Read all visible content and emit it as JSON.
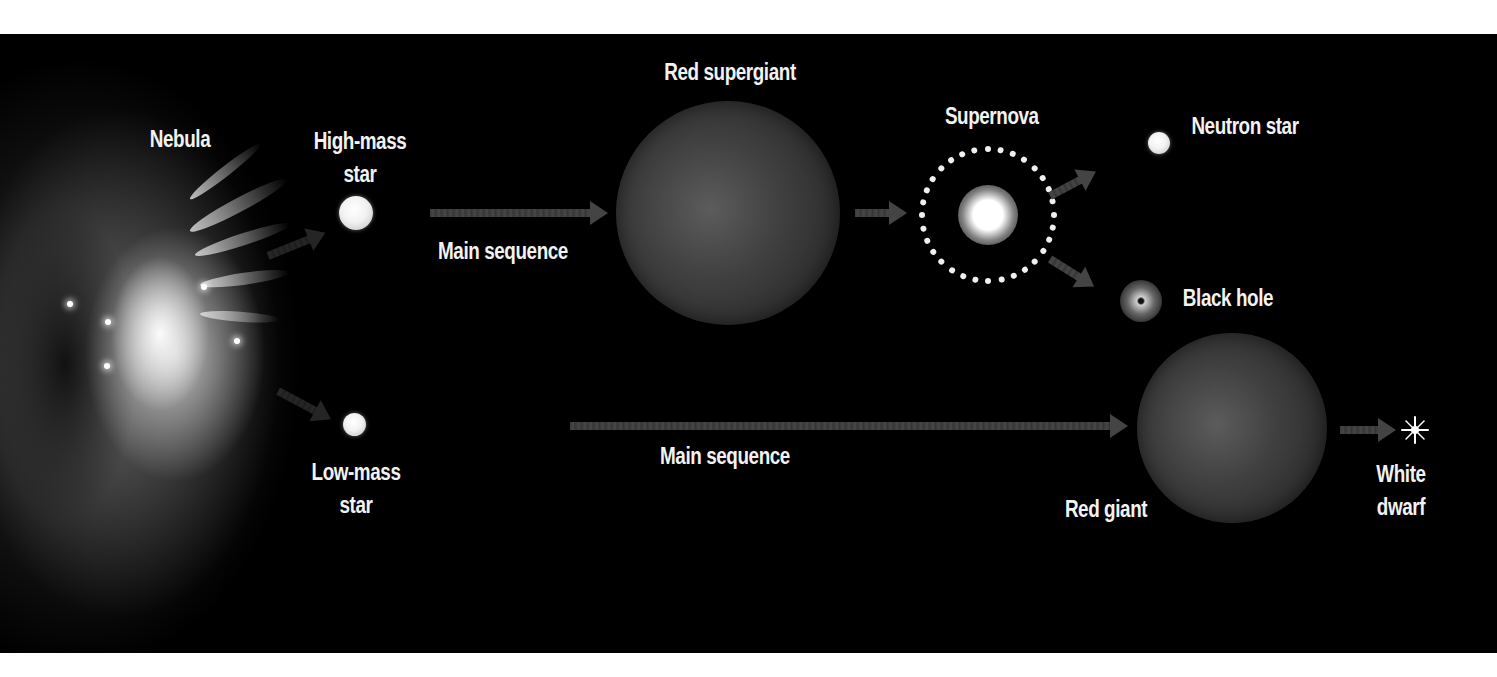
{
  "diagram": {
    "colors": {
      "background": "#000000",
      "page": "#ffffff",
      "label": "#f2f2f2",
      "arrow": "#444444",
      "giant": "#404040"
    },
    "labels": {
      "nebula": "Nebula",
      "high_mass_star_line1": "High-mass",
      "high_mass_star_line2": "star",
      "low_mass_star_line1": "Low-mass",
      "low_mass_star_line2": "star",
      "main_sequence_high": "Main sequence",
      "main_sequence_low": "Main sequence",
      "red_supergiant": "Red supergiant",
      "supernova": "Supernova",
      "neutron_star": "Neutron star",
      "black_hole": "Black hole",
      "red_giant": "Red giant",
      "white_dwarf_line1": "White",
      "white_dwarf_line2": "dwarf"
    },
    "paths": [
      {
        "from": "Nebula",
        "to": "High-mass star"
      },
      {
        "from": "Nebula",
        "to": "Low-mass star"
      },
      {
        "from": "High-mass star",
        "to": "Red supergiant",
        "label": "Main sequence"
      },
      {
        "from": "Red supergiant",
        "to": "Supernova"
      },
      {
        "from": "Supernova",
        "to": "Neutron star"
      },
      {
        "from": "Supernova",
        "to": "Black hole"
      },
      {
        "from": "Low-mass star",
        "to": "Red giant",
        "label": "Main sequence"
      },
      {
        "from": "Red giant",
        "to": "White dwarf"
      }
    ]
  }
}
